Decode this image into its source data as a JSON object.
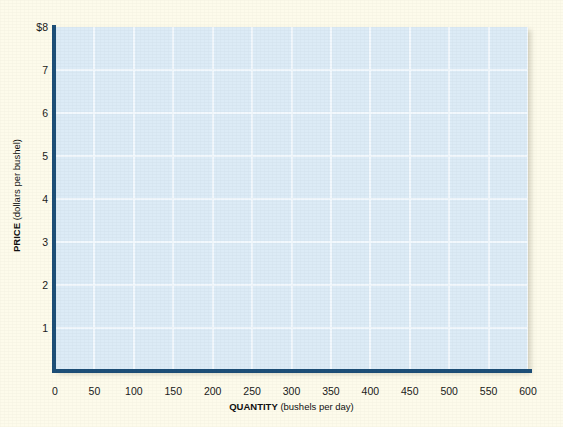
{
  "figure": {
    "background_color": "#fdfbeb",
    "top_caption": "",
    "plot": {
      "fill_color": "#dcebf6",
      "gridline_color": "#f2f9fd",
      "axis_color": "#1d4f78"
    }
  },
  "chart_data": {
    "type": "line",
    "title": "",
    "subtitle": "",
    "xlabel_bold": "QUANTITY",
    "xlabel_rest": " (bushels per day)",
    "ylabel_bold": "PRICE",
    "ylabel_rest": " (dollars per bushel)",
    "xlabel": "QUANTITY (bushels per day)",
    "ylabel": "PRICE (dollars per bushel)",
    "xlim": [
      0,
      600
    ],
    "ylim": [
      0,
      8
    ],
    "xticks": [
      0,
      50,
      100,
      150,
      200,
      250,
      300,
      350,
      400,
      450,
      500,
      550,
      600
    ],
    "xtick_labels": [
      "0",
      "50",
      "100",
      "150",
      "200",
      "250",
      "300",
      "350",
      "400",
      "450",
      "500",
      "550",
      "600"
    ],
    "yticks": [
      1,
      2,
      3,
      4,
      5,
      6,
      7,
      8
    ],
    "ytick_labels": [
      "1",
      "2",
      "3",
      "4",
      "5",
      "6",
      "7",
      "$8"
    ],
    "grid": true,
    "grid_axes": "both",
    "legend": null,
    "legend_position": "none",
    "series": [],
    "annotations": []
  }
}
